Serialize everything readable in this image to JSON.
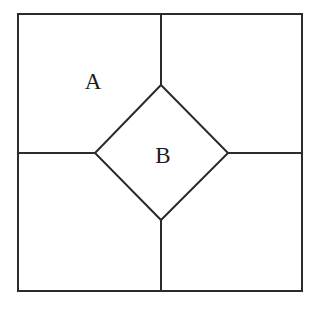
{
  "figure": {
    "background_color": "#ffffff",
    "stroke_color": "#2b2b2b",
    "stroke_width": 2,
    "label_color": "#1a1a1a",
    "canvas": {
      "width": 313,
      "height": 314
    },
    "outer_square": {
      "name": "outer-square",
      "left": 18,
      "top": 14,
      "right": 302,
      "bottom": 291,
      "width": 284,
      "height": 277
    },
    "inner_diamond": {
      "name": "inner-diamond",
      "description": "square rotated 45 degrees, inscribed at center",
      "center_x": 161,
      "center_y": 153,
      "vertices": [
        {
          "name": "top-vertex",
          "x": 161,
          "y": 85
        },
        {
          "name": "right-vertex",
          "x": 228,
          "y": 153
        },
        {
          "name": "bottom-vertex",
          "x": 161,
          "y": 220
        },
        {
          "name": "left-vertex",
          "x": 95,
          "y": 153
        }
      ],
      "half_diagonal_x": 67,
      "half_diagonal_y": 67
    },
    "connector_lines": [
      {
        "name": "top-connector",
        "x1": 161,
        "y1": 14,
        "x2": 161,
        "y2": 85
      },
      {
        "name": "right-connector",
        "x1": 228,
        "y1": 153,
        "x2": 302,
        "y2": 153
      },
      {
        "name": "bottom-connector",
        "x1": 161,
        "y1": 220,
        "x2": 161,
        "y2": 291
      },
      {
        "name": "left-connector",
        "x1": 18,
        "y1": 153,
        "x2": 95,
        "y2": 153
      }
    ],
    "labels": [
      {
        "name": "region-label-a",
        "text": "A",
        "x": 93,
        "y": 81,
        "font_size": 23,
        "region": "upper-left-corner-region"
      },
      {
        "name": "region-label-b",
        "text": "B",
        "x": 163,
        "y": 155,
        "font_size": 23,
        "region": "central-diamond-region"
      }
    ]
  }
}
